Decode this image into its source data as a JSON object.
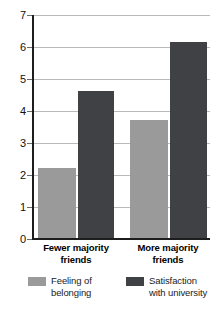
{
  "chart_data": {
    "type": "bar",
    "title": "",
    "subtitle": "",
    "xlabel": "",
    "ylabel": "",
    "ylim": [
      0,
      7
    ],
    "ytick_labels": [
      "0",
      "1",
      "2",
      "3",
      "4",
      "5",
      "6",
      "7"
    ],
    "ytick_values": [
      0,
      1,
      2,
      3,
      4,
      5,
      6,
      7
    ],
    "grid": true,
    "legend_position": "bottom",
    "categories": [
      "Fewer majority friends",
      "More majority friends"
    ],
    "category_lines": [
      [
        "Fewer majority",
        "friends"
      ],
      [
        "More majority",
        "friends"
      ]
    ],
    "series": [
      {
        "name": "Feeling of belonging",
        "name_lines": [
          "Feeling of",
          "belonging"
        ],
        "color": "#9a9a9a",
        "values": [
          2.2,
          3.7
        ]
      },
      {
        "name": "Satisfaction with university",
        "name_lines": [
          "Satisfaction",
          "with university"
        ],
        "color": "#404145",
        "values": [
          4.6,
          6.15
        ]
      }
    ],
    "annotations": []
  },
  "axis": {
    "line_color": "#1d1d1d",
    "grid_color": "#b9b9b9"
  },
  "legend": {
    "items": [
      {
        "label": "Feeling of\nbelonging",
        "color": "#9a9a9a",
        "swatch_name": "legend-swatch-feeling-of-belonging"
      },
      {
        "label": "Satisfaction\nwith university",
        "color": "#404145",
        "swatch_name": "legend-swatch-satisfaction-with-university"
      }
    ]
  },
  "ticks": {
    "labels": [
      "7",
      "6",
      "5",
      "4",
      "3",
      "2",
      "1",
      "0"
    ]
  }
}
